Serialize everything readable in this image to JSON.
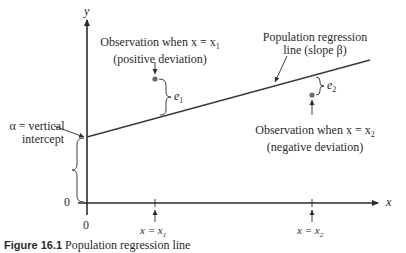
{
  "diagram": {
    "axes": {
      "y_label": "y",
      "x_label": "x",
      "origin_y_label": "0",
      "origin_x_label": "0"
    },
    "regression_line": {
      "label_line1": "Population regression",
      "label_line2": "line (slope β)"
    },
    "intercept": {
      "label_line1": "α = vertical",
      "label_line2": "intercept"
    },
    "observation1": {
      "label_line1": "Observation when x = x",
      "label_sub": "1",
      "label_line2": "(positive deviation)",
      "error_label": "e",
      "error_sub": "1"
    },
    "observation2": {
      "label_line1": "Observation when x = x",
      "label_sub": "2",
      "label_line2": "(negative deviation)",
      "error_label": "e",
      "error_sub": "2"
    },
    "ticks": [
      {
        "label": "x = x",
        "sub": "1"
      },
      {
        "label": "x = x",
        "sub": "2"
      }
    ],
    "caption": {
      "figure": "Figure 16.1",
      "text": "Population regression line"
    },
    "colors": {
      "ink": "#2a2a2a",
      "point": "#6b6b6b"
    }
  }
}
